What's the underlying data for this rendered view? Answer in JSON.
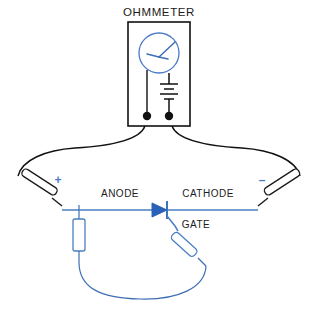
{
  "diagram": {
    "title": "OHMMETER",
    "labels": {
      "anode": "ANODE",
      "cathode": "CATHODE",
      "gate": "GATE",
      "plus": "+",
      "minus": "–"
    },
    "colors": {
      "wire_black": "#111111",
      "wire_blue": "#4a7ec4",
      "symbol_blue": "#2a62b8",
      "text": "#1b1b1b",
      "background": "#ffffff"
    },
    "components": {
      "meter_name": "analog-meter-gauge",
      "battery_name": "battery-symbol",
      "terminal_left_name": "ohmmeter-terminal-left",
      "terminal_right_name": "ohmmeter-terminal-right",
      "scr_name": "thyristor-scr-symbol",
      "probe_positive_name": "test-probe-positive",
      "probe_negative_name": "test-probe-negative",
      "clip_anode_name": "clip-lead-anode",
      "clip_gate_name": "clip-lead-gate"
    }
  }
}
